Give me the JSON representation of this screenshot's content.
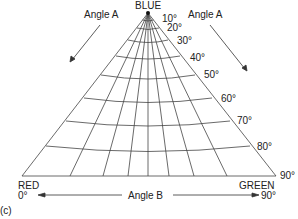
{
  "diagram": {
    "vertices": {
      "top": "BLUE",
      "left": "RED",
      "right": "GREEN"
    },
    "angle_a_label_left": "Angle A",
    "angle_a_label_right": "Angle A",
    "angle_b_label": "Angle B",
    "angle_b_start": "0°",
    "angle_b_end": "90°",
    "angle_a_ticks": [
      "10°",
      "20°",
      "30°",
      "40°",
      "50°",
      "60°",
      "70°",
      "80°",
      "90°"
    ],
    "panel_label": "(c)",
    "line_color": "#333333",
    "grid": {
      "radial_lines": 9,
      "arc_count": 9
    }
  }
}
